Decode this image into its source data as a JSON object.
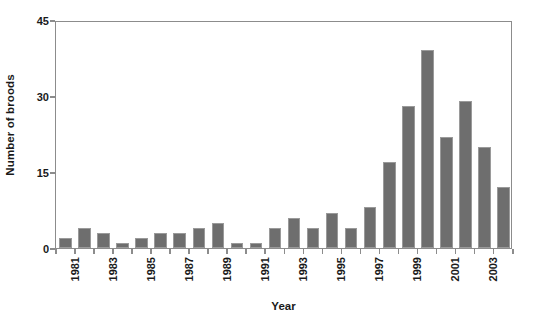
{
  "chart_data": {
    "type": "bar",
    "title": "",
    "xlabel": "Year",
    "ylabel": "Number of broods",
    "categories": [
      "1981",
      "1982",
      "1983",
      "1984",
      "1985",
      "1986",
      "1987",
      "1988",
      "1989",
      "1990",
      "1991",
      "1992",
      "1993",
      "1994",
      "1995",
      "1996",
      "1997",
      "1998",
      "1999",
      "2000",
      "2001",
      "2002",
      "2003",
      "2004"
    ],
    "values": [
      2,
      4,
      3,
      1,
      2,
      3,
      3,
      4,
      5,
      1,
      1,
      4,
      6,
      4,
      7,
      4,
      8,
      17,
      28,
      39,
      22,
      29,
      20,
      12
    ],
    "ylim": [
      0,
      45
    ],
    "yticks": [
      0,
      15,
      30,
      45
    ],
    "ytick_labels": [
      "0",
      "15",
      "30",
      "45"
    ],
    "xtick_labels": [
      "1981",
      "1983",
      "1985",
      "1987",
      "1989",
      "1991",
      "1993",
      "1995",
      "1997",
      "1999",
      "2001",
      "2003"
    ],
    "xtick_label_rotation": 90,
    "grid": false,
    "legend": null,
    "bar_color": "#6e6e6e",
    "axis_color": "#8c8c8c",
    "text_color": "#1a1a1a"
  }
}
